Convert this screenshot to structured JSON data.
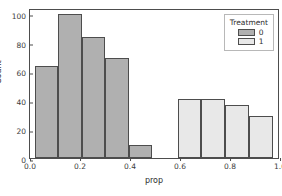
{
  "partial_top_text": "",
  "chart_data": {
    "type": "bar",
    "title": "",
    "xlabel": "prop",
    "ylabel": "Count",
    "xlim": [
      0.0,
      1.0
    ],
    "ylim": [
      0,
      104
    ],
    "xticks": [
      "0.0",
      "0.2",
      "0.4",
      "0.6",
      "0.8",
      "1.0"
    ],
    "xtick_values": [
      0.0,
      0.2,
      0.4,
      0.6,
      0.8,
      1.0
    ],
    "yticks": [
      "0",
      "20",
      "40",
      "60",
      "80",
      "100"
    ],
    "ytick_values": [
      0,
      20,
      40,
      60,
      80,
      100
    ],
    "grid": false,
    "legend": {
      "title": "Treatment",
      "position": "upper right",
      "entries": [
        {
          "label": "0",
          "color": "#b0b0b0"
        },
        {
          "label": "1",
          "color": "#e8e8e8"
        }
      ]
    },
    "series": [
      {
        "name": "0",
        "color": "#b0b0b0",
        "bins": [
          {
            "x0": 0.02,
            "x1": 0.113,
            "value": 64
          },
          {
            "x0": 0.113,
            "x1": 0.207,
            "value": 100
          },
          {
            "x0": 0.207,
            "x1": 0.3,
            "value": 84
          },
          {
            "x0": 0.3,
            "x1": 0.394,
            "value": 69
          },
          {
            "x0": 0.394,
            "x1": 0.487,
            "value": 9
          }
        ]
      },
      {
        "name": "1",
        "color": "#e8e8e8",
        "bins": [
          {
            "x0": 0.59,
            "x1": 0.685,
            "value": 41
          },
          {
            "x0": 0.685,
            "x1": 0.78,
            "value": 41
          },
          {
            "x0": 0.78,
            "x1": 0.875,
            "value": 37
          },
          {
            "x0": 0.875,
            "x1": 0.97,
            "value": 29
          }
        ]
      }
    ]
  }
}
